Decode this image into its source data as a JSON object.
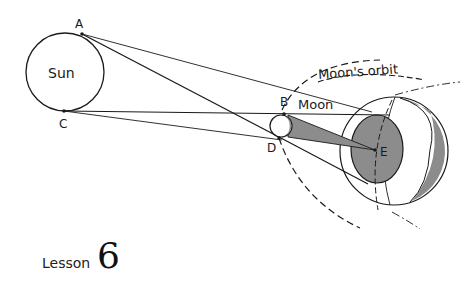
{
  "diagram": {
    "labels": {
      "sun": "Sun",
      "moon": "Moon",
      "orbit": "Moon's orbit",
      "point_a": "A",
      "point_b": "B",
      "point_c": "C",
      "point_d": "D",
      "point_e": "E"
    },
    "colors": {
      "line": "#1a1a1a",
      "shadow": "#8c8c8c",
      "background": "#ffffff"
    }
  },
  "footer": {
    "lesson_word": "Lesson",
    "lesson_number": "6"
  }
}
